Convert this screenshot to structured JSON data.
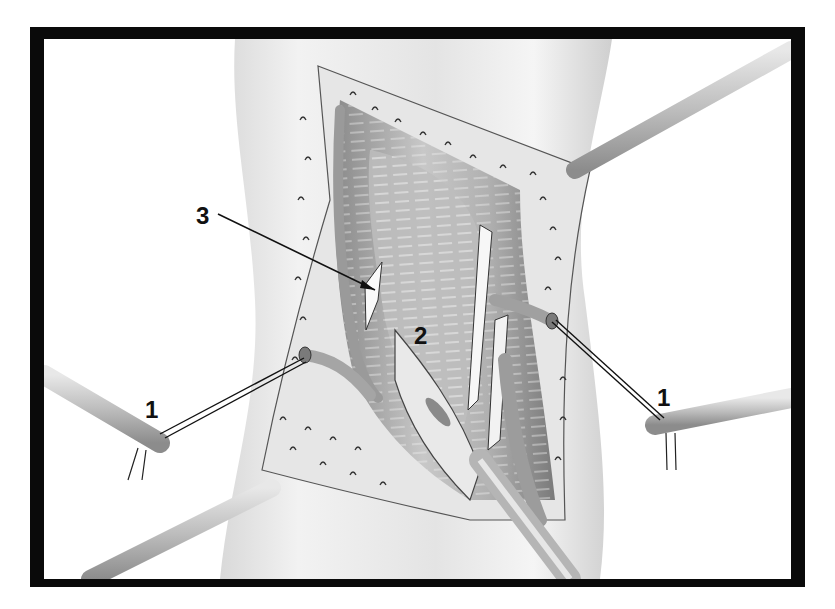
{
  "figure": {
    "type": "surgical-illustration",
    "style": "grayscale line drawing with black frame",
    "frame_color": "#0a0a0a",
    "background_color": "#ffffff",
    "labels": [
      {
        "id": "label-3",
        "text": "3",
        "x": 205,
        "y": 224,
        "points_to": "white structure left of central muscle"
      },
      {
        "id": "label-2",
        "text": "2",
        "x": 423,
        "y": 345,
        "points_to": "central muscle belly"
      },
      {
        "id": "label-1-left",
        "text": "1",
        "x": 152,
        "y": 418,
        "points_to": "ligated vessel stump, left"
      },
      {
        "id": "label-1-right",
        "text": "1",
        "x": 665,
        "y": 405,
        "points_to": "ligated vessel stump, right"
      }
    ],
    "instruments": [
      {
        "name": "retractor-top-right"
      },
      {
        "name": "retractor-bottom-left"
      },
      {
        "name": "suture-holder-left"
      },
      {
        "name": "suture-holder-right"
      },
      {
        "name": "forceps-bottom-center"
      }
    ]
  }
}
